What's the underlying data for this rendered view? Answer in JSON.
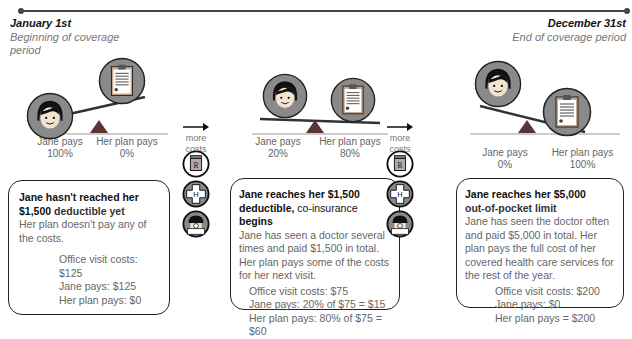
{
  "timeline": {
    "start": {
      "date": "January 1st",
      "label": "Beginning of coverage period"
    },
    "end": {
      "date": "December 31st",
      "label": "End of coverage period"
    }
  },
  "more_costs": {
    "label_line1": "more",
    "label_line2": "costs",
    "icons": [
      "prescription-rx-icon",
      "hospital-h-icon",
      "doctor-icon"
    ]
  },
  "stages": [
    {
      "jane_pays_label": "Jane pays",
      "jane_pays_pct": "100%",
      "plan_pays_label": "Her plan pays",
      "plan_pays_pct": "0%",
      "heading_part1": "Jane hasn't reached her",
      "heading_part2": "$1,500",
      "heading_part3": "deductible yet",
      "description": "Her plan doesn't pay any of the costs.",
      "office_visit": "Office visit costs: $125",
      "jane_pays": "Jane pays: $125",
      "plan_pays": "Her plan pays: $0"
    },
    {
      "jane_pays_label": "Jane pays",
      "jane_pays_pct": "20%",
      "plan_pays_label": "Her plan pays",
      "plan_pays_pct": "80%",
      "heading_part1": "Jane reaches her $1,500",
      "heading_part2": "deductible,",
      "heading_part3": "co-insurance",
      "heading_part4": "begins",
      "description": "Jane has seen a doctor several times and paid $1,500 in total. Her plan pays some of the costs for her next visit.",
      "office_visit": "Office visit costs: $75",
      "jane_pays": "Jane pays: 20% of $75 = $15",
      "plan_pays": "Her plan pays: 80% of $75 = $60"
    },
    {
      "jane_pays_label": "Jane pays",
      "jane_pays_pct": "0%",
      "plan_pays_label": "Her plan pays",
      "plan_pays_pct": "100%",
      "heading_part1": "Jane  reaches her $5,000",
      "heading_part2": "out-of-pocket limit",
      "description": "Jane has seen the doctor often and paid $5,000 in total. Her plan pays the full cost of her covered health care services for the rest of the year.",
      "office_visit": "Office visit costs: $200",
      "jane_pays": "Jane pays: $0",
      "plan_pays": "Her plan pays = $200"
    }
  ],
  "colors": {
    "circle_fill": "#8a8a8a",
    "triangle": "#5a3434",
    "beam": "#333333",
    "text_muted": "#666666"
  }
}
